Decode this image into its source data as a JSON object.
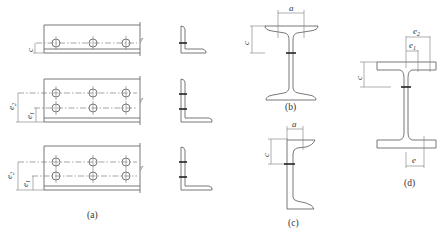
{
  "figure": {
    "panels": [
      {
        "id": "a",
        "caption": "(a)",
        "description": "Angle steel plates with bolt rows and L-section views",
        "rows": [
          {
            "bolt_rows": 1,
            "dimension_labels": [
              "c"
            ]
          },
          {
            "bolt_rows": 2,
            "dimension_labels": [
              "e2",
              "e1"
            ]
          },
          {
            "bolt_rows": 2,
            "dimension_labels": [
              "e2",
              "e1"
            ]
          }
        ]
      },
      {
        "id": "b",
        "caption": "(b)",
        "description": "I-beam section",
        "dimension_labels": [
          "a",
          "c"
        ]
      },
      {
        "id": "c",
        "caption": "(c)",
        "description": "Channel section",
        "dimension_labels": [
          "a",
          "c"
        ]
      },
      {
        "id": "d",
        "caption": "(d)",
        "description": "H-section",
        "dimension_labels": [
          "e2",
          "e1",
          "c",
          "e"
        ]
      }
    ],
    "labels": {
      "c": "c",
      "e": "e",
      "a": "a",
      "e_base": "e",
      "sub1": "1",
      "sub2": "2"
    },
    "captions": {
      "a": "(a)",
      "b": "(b)",
      "c": "(c)",
      "d": "(d)"
    }
  }
}
